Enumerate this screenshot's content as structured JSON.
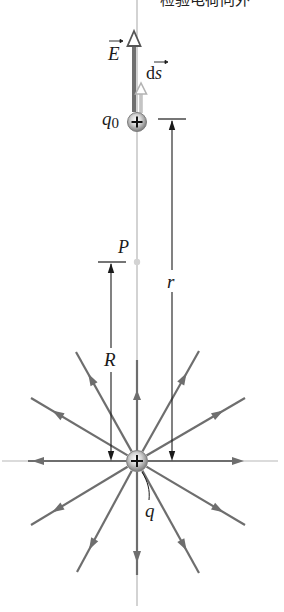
{
  "caption_fragment": "检验电荷向外",
  "labels": {
    "E_vector": "E",
    "ds_vector": "ds",
    "ds_prefix": "d",
    "ds_suffix": "s",
    "test_charge": "q",
    "test_charge_sub": "0",
    "point": "P",
    "distance_r": "r",
    "distance_R": "R",
    "source_charge": "q",
    "charge_sign": "+"
  },
  "colors": {
    "field_line": "#6e6e6e",
    "axis_line": "#c8c8c8",
    "E_arrow": "#6e6e6e",
    "ds_arrow": "#bdbdbd",
    "dimension_line": "#1a1a1a",
    "charge_fill": "#9a9a9a",
    "point_P": "#d0d0d0"
  },
  "geometry": {
    "source_charge_center": [
      137,
      461
    ],
    "test_charge_center": [
      137,
      122
    ],
    "point_P": [
      137,
      262
    ],
    "field_line_count": 16
  }
}
